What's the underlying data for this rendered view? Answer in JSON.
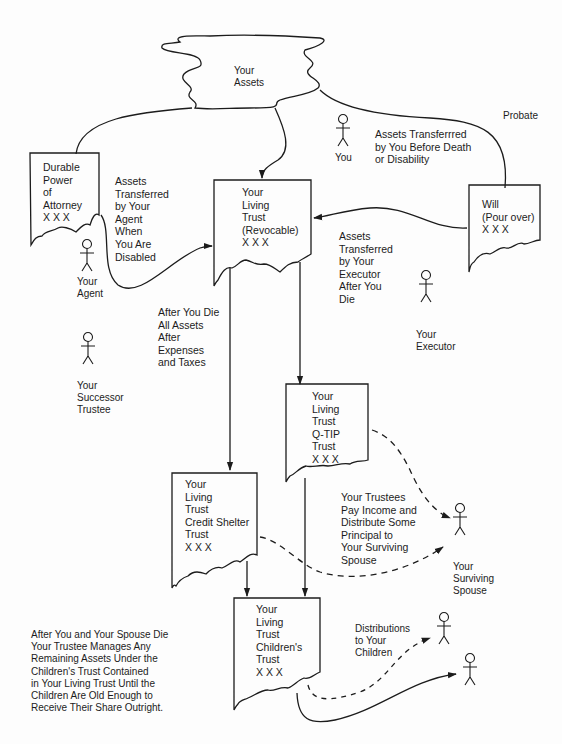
{
  "diagram": {
    "colors": {
      "ink": "#1c1c1c",
      "background": "#fdfdfd"
    },
    "assets_cloud": {
      "label": "Your\nAssets"
    },
    "documents": {
      "durable_power": {
        "label": "Durable\nPower\nof\nAttorney\nX X X"
      },
      "living_trust": {
        "label": "Your\nLiving\nTrust\n(Revocable)\nX X X"
      },
      "will": {
        "label": "Will\n(Pour over)\nX X X"
      },
      "qtip_trust": {
        "label": "Your\nLiving\nTrust\nQ-TIP\nTrust\nX X X"
      },
      "credit_shelter_trust": {
        "label": "Your\nLiving\nTrust\nCredit Shelter\nTrust\nX X X"
      },
      "childrens_trust": {
        "label": "Your\nLiving\nTrust\nChildren's\nTrust\nX X X"
      }
    },
    "people": {
      "you": {
        "label": "You"
      },
      "agent": {
        "label": "Your\nAgent"
      },
      "successor_trustee": {
        "label": "Your\nSuccessor\nTrustee"
      },
      "executor": {
        "label": "Your\nExecutor"
      },
      "surviving_spouse": {
        "label": "Your\nSurviving\nSpouse"
      },
      "child_1": {
        "label": ""
      },
      "child_2": {
        "label": ""
      }
    },
    "annotations": {
      "probate": "Probate",
      "assets_by_you": "Assets Transferrred\nby You Before Death\nor Disability",
      "assets_by_agent": "Assets\nTransferred\nby Your\nAgent\nWhen\nYou Are\nDisabled",
      "assets_by_executor": "Assets\nTransferred\nby Your\nExecutor\nAfter You\nDie",
      "after_you_die": "After You Die\nAll Assets\nAfter\nExpenses\nand Taxes",
      "trustees_pay": "Your Trustees\nPay Income and\nDistribute Some\nPrincipal to\nYour Surviving\nSpouse",
      "distributions_children": "Distributions\nto Your\nChildren",
      "after_spouse_die": "After You and Your Spouse Die\nYour Trustee Manages Any\nRemaining Assets Under the\nChildren's Trust Contained\nin Your Living Trust Until the\nChildren Are Old Enough to\nReceive Their Share Outright."
    }
  }
}
